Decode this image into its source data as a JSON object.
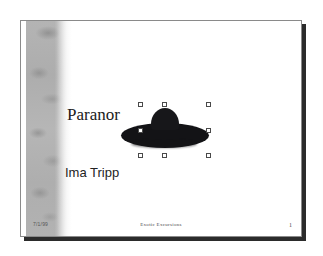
{
  "slide": {
    "title": "Paranor",
    "subtitle": "Ima Tripp",
    "footer": {
      "date": "7/1/99",
      "center_text": "Exotic Excursions",
      "page_number": "1"
    },
    "objects": {
      "ufo": {
        "name": "flying-saucer",
        "fill_color": "#131316",
        "selected": true,
        "handle_count": 8
      }
    },
    "design": {
      "background_color": "#ffffff",
      "band_color": "#b2b2b2",
      "border_color": "#8a8a8a",
      "shadow_color": "#2b2b2b",
      "title_color": "#1a1a1a",
      "subtitle_color": "#232323"
    }
  }
}
